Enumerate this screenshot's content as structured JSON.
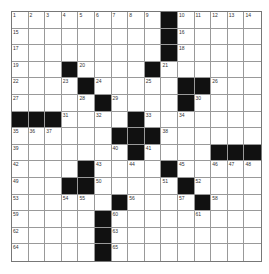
{
  "puzzle": {
    "rows": 15,
    "cols": 15,
    "grid": [
      [
        "1",
        "2",
        "3",
        "4",
        "5",
        "6",
        "7",
        "8",
        "9",
        "#",
        "10",
        "11",
        "12",
        "13",
        "14"
      ],
      [
        "15",
        "",
        "",
        "",
        "",
        "",
        "",
        "",
        "",
        "#",
        "16",
        "",
        "",
        "",
        ""
      ],
      [
        "17",
        "",
        "",
        "",
        "",
        "",
        "",
        "",
        "",
        "#",
        "18",
        "",
        "",
        "",
        ""
      ],
      [
        "19",
        "",
        "",
        "#",
        "20",
        "",
        "",
        "",
        "#",
        "21",
        "",
        "",
        "",
        "",
        ""
      ],
      [
        "22",
        "",
        "",
        "23",
        "#",
        "24",
        "",
        "",
        "25",
        "",
        "#",
        "#",
        "26",
        "",
        ""
      ],
      [
        "27",
        "",
        "",
        "",
        "28",
        "#",
        "29",
        "",
        "",
        "",
        "#",
        "30",
        "",
        "",
        ""
      ],
      [
        "#",
        "#",
        "#",
        "31",
        "",
        "32",
        "",
        "#",
        "33",
        "",
        "34",
        "",
        "",
        "",
        ""
      ],
      [
        "35",
        "36",
        "37",
        "",
        "",
        "",
        "#",
        "#",
        "#",
        "38",
        "",
        "",
        "",
        "",
        ""
      ],
      [
        "39",
        "",
        "",
        "",
        "",
        "",
        "40",
        "#",
        "41",
        "",
        "",
        "",
        "#",
        "#",
        "#"
      ],
      [
        "42",
        "",
        "",
        "",
        "#",
        "43",
        "",
        "44",
        "",
        "#",
        "45",
        "",
        "46",
        "47",
        "48"
      ],
      [
        "49",
        "",
        "",
        "#",
        "#",
        "50",
        "",
        "",
        "",
        "51",
        "#",
        "52",
        "",
        "",
        ""
      ],
      [
        "53",
        "",
        "",
        "54",
        "55",
        "",
        "#",
        "56",
        "",
        "",
        "57",
        "#",
        "58",
        "",
        ""
      ],
      [
        "59",
        "",
        "",
        "",
        "",
        "#",
        "60",
        "",
        "",
        "",
        "",
        "61",
        "",
        "",
        ""
      ],
      [
        "62",
        "",
        "",
        "",
        "",
        "#",
        "63",
        "",
        "",
        "",
        "",
        "",
        "",
        "",
        ""
      ],
      [
        "64",
        "",
        "",
        "",
        "",
        "#",
        "65",
        "",
        "",
        "",
        "",
        "",
        "",
        "",
        ""
      ]
    ],
    "colors": {
      "block": "#111111",
      "cell": "#ffffff",
      "line": "#999999",
      "number": "#333333"
    }
  }
}
